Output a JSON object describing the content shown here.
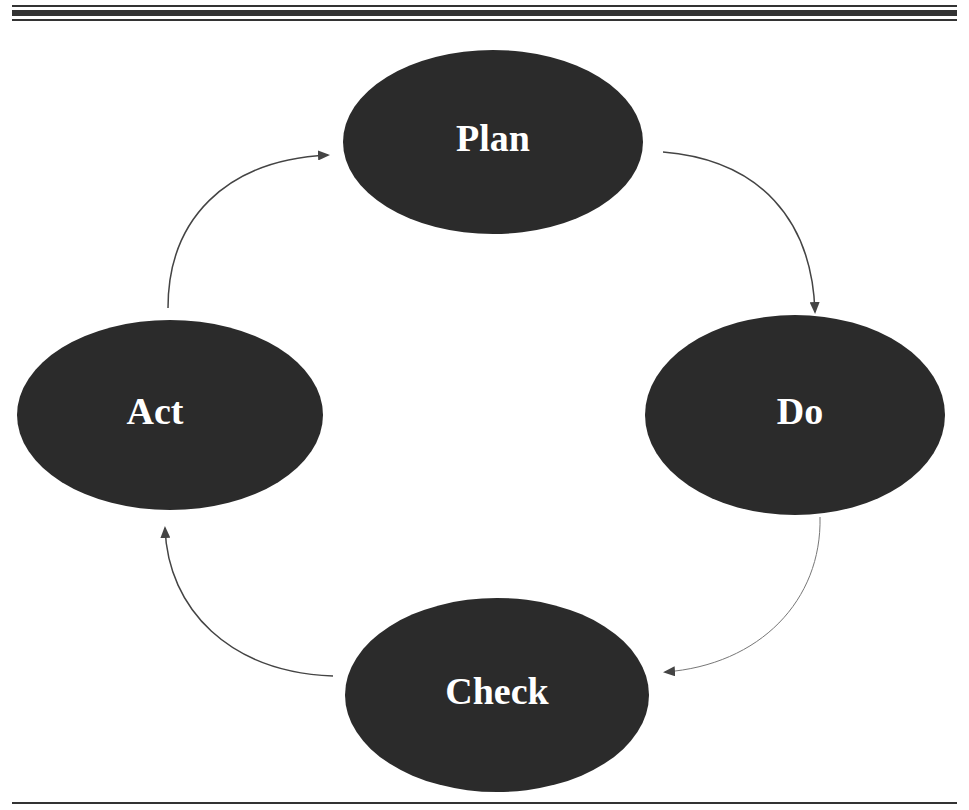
{
  "diagram": {
    "type": "cycle",
    "nodes": [
      {
        "id": "plan",
        "label": "Plan"
      },
      {
        "id": "do",
        "label": "Do"
      },
      {
        "id": "check",
        "label": "Check"
      },
      {
        "id": "act",
        "label": "Act"
      }
    ],
    "edges": [
      {
        "from": "plan",
        "to": "do"
      },
      {
        "from": "do",
        "to": "check"
      },
      {
        "from": "check",
        "to": "act"
      },
      {
        "from": "act",
        "to": "plan"
      }
    ],
    "colors": {
      "node_fill": "#2b2b2b",
      "label_text": "#ffffff",
      "arrow": "#444444",
      "rules": "#333333"
    }
  }
}
